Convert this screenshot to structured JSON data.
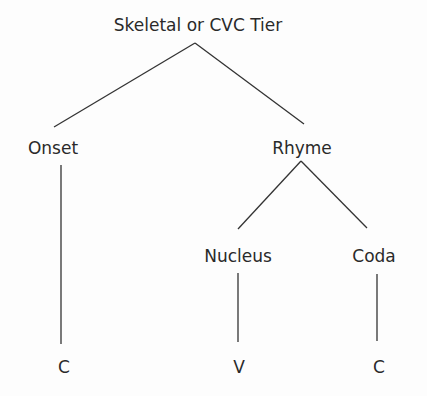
{
  "diagram": {
    "title": "Skeletal or CVC Tier",
    "nodes": {
      "root": "Skeletal or CVC Tier",
      "onset": "Onset",
      "rhyme": "Rhyme",
      "nucleus": "Nucleus",
      "coda": "Coda",
      "onset_slot": "C",
      "nucleus_slot": "V",
      "coda_slot": "C"
    },
    "edges": [
      [
        "Skeletal or CVC Tier",
        "Onset"
      ],
      [
        "Skeletal or CVC Tier",
        "Rhyme"
      ],
      [
        "Rhyme",
        "Nucleus"
      ],
      [
        "Rhyme",
        "Coda"
      ],
      [
        "Onset",
        "C"
      ],
      [
        "Nucleus",
        "V"
      ],
      [
        "Coda",
        "C"
      ]
    ],
    "line_color": "#333333"
  }
}
